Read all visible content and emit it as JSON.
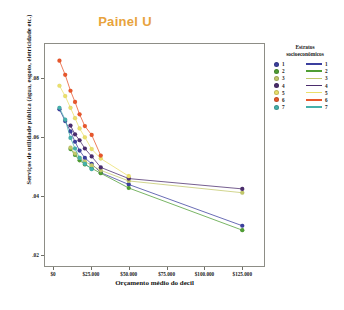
{
  "chart_data": {
    "type": "line",
    "title": "Painel U",
    "xlabel": "Orçamento médio do decil",
    "ylabel": "Serviços de utilidade pública (água, esgoto, eletricidade etc.)",
    "xlim": [
      -6000,
      140000
    ],
    "ylim": [
      0.016,
      0.092
    ],
    "grid": false,
    "legend_position": "right",
    "legend_title_line1": "Estratos",
    "legend_title_line2": "socioeconômicos",
    "x_ticks": [
      0,
      25000,
      50000,
      75000,
      100000,
      125000
    ],
    "x_tick_labels": [
      "$0",
      "$25.000",
      "$50.000",
      "$75.000",
      "$100.000",
      "$125.000"
    ],
    "y_ticks": [
      0.02,
      0.04,
      0.06,
      0.08
    ],
    "y_tick_labels": [
      ".02",
      ".04",
      ".06",
      ".08"
    ],
    "series": [
      {
        "name": "1",
        "label": "1",
        "color": "#3b3f9e",
        "x": [
          4200,
          8000,
          11500,
          14500,
          17500,
          21000,
          25500,
          31500,
          50000,
          125000
        ],
        "y": [
          0.0695,
          0.0655,
          0.062,
          0.0585,
          0.0555,
          0.053,
          0.051,
          0.048,
          0.044,
          0.03
        ]
      },
      {
        "name": "2",
        "label": "2",
        "color": "#4f9e34",
        "x": [
          11500,
          14500,
          17500,
          21000,
          25500,
          31500,
          50000,
          125000
        ],
        "y": [
          0.056,
          0.054,
          0.0522,
          0.0508,
          0.0495,
          0.0478,
          0.0428,
          0.0285
        ]
      },
      {
        "name": "3",
        "label": "3",
        "color": "#c2c86a",
        "x": [
          11500,
          14500,
          17500,
          21000,
          25500,
          31500,
          50000,
          125000
        ],
        "y": [
          0.0565,
          0.0545,
          0.053,
          0.0518,
          0.0505,
          0.0488,
          0.0452,
          0.0412
        ]
      },
      {
        "name": "4",
        "label": "4",
        "color": "#4b2d6d",
        "x": [
          11500,
          14500,
          17500,
          21000,
          25500,
          31500,
          50000,
          125000
        ],
        "y": [
          0.064,
          0.061,
          0.059,
          0.0562,
          0.0535,
          0.0498,
          0.046,
          0.0425
        ]
      },
      {
        "name": "5",
        "label": "5",
        "color": "#ebe06a",
        "x": [
          4200,
          8000,
          11500,
          14500,
          17500,
          21000,
          25500,
          31500,
          50000
        ],
        "y": [
          0.0775,
          0.074,
          0.07,
          0.0665,
          0.063,
          0.06,
          0.056,
          0.0528,
          0.0468
        ]
      },
      {
        "name": "6",
        "label": "6",
        "color": "#e8562b",
        "x": [
          4200,
          8000,
          11500,
          14500,
          17500,
          21000,
          25500,
          31500
        ],
        "y": [
          0.086,
          0.0812,
          0.0758,
          0.072,
          0.0678,
          0.0638,
          0.0608,
          0.0538
        ]
      },
      {
        "name": "7",
        "label": "7",
        "color": "#45b0ab",
        "x": [
          4200,
          8000,
          11500,
          14500,
          17500,
          21000,
          25500
        ],
        "y": [
          0.07,
          0.066,
          0.0598,
          0.0562,
          0.053,
          0.051,
          0.0492
        ]
      }
    ]
  }
}
